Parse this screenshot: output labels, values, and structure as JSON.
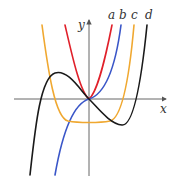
{
  "figure": {
    "width": 178,
    "height": 179,
    "origin": {
      "x": 89,
      "y": 99
    },
    "axes": {
      "x_label": "x",
      "y_label": "y",
      "x_axis": {
        "x1": 14,
        "x2": 166,
        "y": 99
      },
      "y_axis": {
        "x": 89,
        "y1": 176,
        "y2": 20
      },
      "color": "#555555"
    },
    "curves": [
      {
        "label": "a",
        "color": "#e0202a",
        "label_pos": {
          "x": 108,
          "y": 19
        },
        "path": "M65,25 C72,55 80,92 89,99 C98,92 106,55 112,25"
      },
      {
        "label": "b",
        "color": "#3a56c8",
        "label_pos": {
          "x": 119,
          "y": 19
        },
        "path": "M55,175 C62,135 72,104 89,99 C106,94 116,63 121,25"
      },
      {
        "label": "c",
        "color": "#f0a830",
        "label_pos": {
          "x": 131,
          "y": 19
        },
        "path": "M42,25 C48,70 55,118 68,121 C78,123 100,123 110,121 C123,118 130,70 134,25"
      },
      {
        "label": "d",
        "color": "#1a1a1a",
        "label_pos": {
          "x": 145,
          "y": 19
        },
        "path": "M30,175 C35,130 40,78 55,73 C68,69 80,90 89,99 C98,108 110,124 122,125 C134,126 142,75 147,25"
      }
    ]
  }
}
